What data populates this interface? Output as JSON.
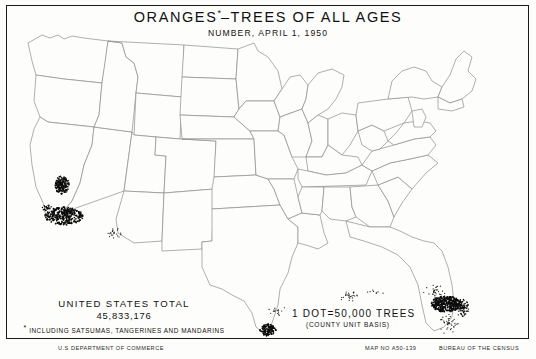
{
  "sheet": {
    "width": 536,
    "height": 359,
    "background_color": "#fdfdfb",
    "frame_color": "#1a1a1a",
    "line_color": "#8d8d8d",
    "dot_color": "#0b0b0b"
  },
  "title": {
    "main_before_asterisk": "ORANGES",
    "asterisk": "*",
    "main_after_asterisk": "–TREES OF ALL AGES",
    "subtitle": "NUMBER, APRIL 1, 1950"
  },
  "legend_left": {
    "line1": "UNITED STATES TOTAL",
    "total_number": "45,833,176",
    "footnote_marker": "*",
    "footnote": "INCLUDING SATSUMAS, TANGERINES AND MANDARINS"
  },
  "legend_right": {
    "dot_value": "1 DOT=50,000 TREES",
    "basis": "(COUNTY UNIT BASIS)"
  },
  "footer": {
    "agency": "U.S DEPARTMENT OF COMMERCE",
    "map_number": "MAP NO A50-139",
    "bureau": "BUREAU OF THE CENSUS"
  },
  "chart_data": {
    "type": "map",
    "map_kind": "dot-density",
    "title": "ORANGES*–TREES OF ALL AGES",
    "subtitle": "NUMBER, APRIL 1, 1950",
    "region": "United States (conterminous)",
    "unit": "county",
    "dot_value": 50000,
    "dot_unit": "trees",
    "national_total": 45833176,
    "clusters": [
      {
        "name": "southern-california",
        "label": "Southern California (Los Angeles, Orange, Riverside, San Bernardino, San Diego)",
        "cx": 58,
        "cy": 211,
        "rx": 19,
        "ry": 9,
        "dots": 300,
        "density": "solid",
        "seed": 11
      },
      {
        "name": "central-valley-california",
        "label": "Central Valley California (Tulare, Fresno, Kern)",
        "cx": 56,
        "cy": 180,
        "rx": 7,
        "ry": 9,
        "dots": 150,
        "density": "solid",
        "seed": 23
      },
      {
        "name": "ventura-santa-barbara",
        "label": "Ventura / Santa Barbara coastal California",
        "cx": 41,
        "cy": 203,
        "rx": 5,
        "ry": 3,
        "dots": 30,
        "density": "medium",
        "seed": 31
      },
      {
        "name": "arizona-desert",
        "label": "Arizona (Maricopa, Yuma)",
        "cx": 108,
        "cy": 228,
        "rx": 9,
        "ry": 5,
        "dots": 22,
        "density": "sparse",
        "seed": 47
      },
      {
        "name": "lower-rio-grande-texas",
        "label": "Lower Rio Grande Valley, Texas (Hidalgo, Cameron)",
        "cx": 262,
        "cy": 325,
        "rx": 8,
        "ry": 6,
        "dots": 110,
        "density": "solid",
        "seed": 59
      },
      {
        "name": "texas-gulf-scatter",
        "label": "Texas Gulf coast scatter",
        "cx": 272,
        "cy": 305,
        "rx": 9,
        "ry": 6,
        "dots": 16,
        "density": "sparse",
        "seed": 67
      },
      {
        "name": "louisiana-gulf",
        "label": "Louisiana (Plaquemines, lower delta)",
        "cx": 344,
        "cy": 291,
        "rx": 12,
        "ry": 6,
        "dots": 26,
        "density": "sparse",
        "seed": 73
      },
      {
        "name": "florida-central-ridge",
        "label": "Florida central ridge (Polk, Lake, Orange, Highlands)",
        "cx": 440,
        "cy": 299,
        "rx": 15,
        "ry": 8,
        "dots": 330,
        "density": "solid",
        "seed": 83
      },
      {
        "name": "florida-indian-river",
        "label": "Florida Indian River (Indian River, St. Lucie, Brevard)",
        "cx": 456,
        "cy": 303,
        "rx": 7,
        "ry": 9,
        "dots": 90,
        "density": "medium",
        "seed": 97
      },
      {
        "name": "florida-south-peninsula",
        "label": "Florida south peninsula scatter",
        "cx": 443,
        "cy": 318,
        "rx": 10,
        "ry": 12,
        "dots": 40,
        "density": "sparse",
        "seed": 101
      },
      {
        "name": "florida-north",
        "label": "Florida north / panhandle edge scatter",
        "cx": 428,
        "cy": 286,
        "rx": 12,
        "ry": 7,
        "dots": 30,
        "density": "sparse",
        "seed": 109
      },
      {
        "name": "alabama-gulf-edge",
        "label": "Gulf coast Alabama / Mississippi light scatter",
        "cx": 370,
        "cy": 288,
        "rx": 9,
        "ry": 4,
        "dots": 8,
        "density": "sparse",
        "seed": 113
      }
    ]
  }
}
